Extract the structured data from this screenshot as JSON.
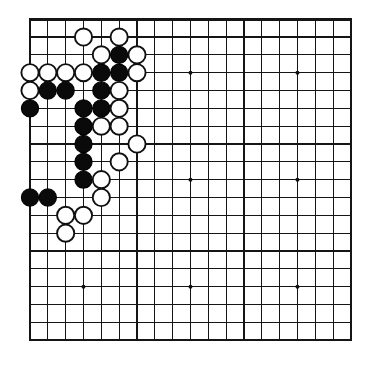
{
  "board": {
    "name": "go-board",
    "size": 19,
    "origin_x": 30,
    "origin_y": 19.2,
    "spacing": 17.83,
    "stone_radius": 8.6,
    "star_radius": 2.0,
    "colors": {
      "background": "#ffffff",
      "line": "#151515",
      "border": "#151515",
      "black_stone": "#0a0a0a",
      "white_stone_fill": "#ffffff",
      "white_stone_edge": "#101010",
      "star_point": "#101010"
    },
    "star_points": [
      {
        "col": 3,
        "row": 3
      },
      {
        "col": 9,
        "row": 3
      },
      {
        "col": 15,
        "row": 3
      },
      {
        "col": 3,
        "row": 9
      },
      {
        "col": 9,
        "row": 9
      },
      {
        "col": 15,
        "row": 9
      },
      {
        "col": 3,
        "row": 15
      },
      {
        "col": 9,
        "row": 15
      },
      {
        "col": 15,
        "row": 15
      }
    ],
    "stones": [
      {
        "col": 3,
        "row": 1,
        "color": "white"
      },
      {
        "col": 5,
        "row": 1,
        "color": "white"
      },
      {
        "col": 4,
        "row": 2,
        "color": "white"
      },
      {
        "col": 5,
        "row": 2,
        "color": "black"
      },
      {
        "col": 6,
        "row": 2,
        "color": "white"
      },
      {
        "col": 0,
        "row": 3,
        "color": "white"
      },
      {
        "col": 1,
        "row": 3,
        "color": "white"
      },
      {
        "col": 2,
        "row": 3,
        "color": "white"
      },
      {
        "col": 3,
        "row": 3,
        "color": "white"
      },
      {
        "col": 4,
        "row": 3,
        "color": "black"
      },
      {
        "col": 5,
        "row": 3,
        "color": "black"
      },
      {
        "col": 6,
        "row": 3,
        "color": "white"
      },
      {
        "col": 0,
        "row": 4,
        "color": "white"
      },
      {
        "col": 1,
        "row": 4,
        "color": "black"
      },
      {
        "col": 2,
        "row": 4,
        "color": "black"
      },
      {
        "col": 4,
        "row": 4,
        "color": "black"
      },
      {
        "col": 5,
        "row": 4,
        "color": "white"
      },
      {
        "col": 0,
        "row": 5,
        "color": "black"
      },
      {
        "col": 3,
        "row": 5,
        "color": "black"
      },
      {
        "col": 4,
        "row": 5,
        "color": "black"
      },
      {
        "col": 5,
        "row": 5,
        "color": "white"
      },
      {
        "col": 3,
        "row": 6,
        "color": "black"
      },
      {
        "col": 4,
        "row": 6,
        "color": "white"
      },
      {
        "col": 5,
        "row": 6,
        "color": "white"
      },
      {
        "col": 3,
        "row": 7,
        "color": "black"
      },
      {
        "col": 6,
        "row": 7,
        "color": "white"
      },
      {
        "col": 3,
        "row": 8,
        "color": "black"
      },
      {
        "col": 5,
        "row": 8,
        "color": "white"
      },
      {
        "col": 3,
        "row": 9,
        "color": "black"
      },
      {
        "col": 4,
        "row": 9,
        "color": "white"
      },
      {
        "col": 0,
        "row": 10,
        "color": "black"
      },
      {
        "col": 1,
        "row": 10,
        "color": "black"
      },
      {
        "col": 4,
        "row": 10,
        "color": "white"
      },
      {
        "col": 2,
        "row": 11,
        "color": "white"
      },
      {
        "col": 3,
        "row": 11,
        "color": "white"
      },
      {
        "col": 2,
        "row": 12,
        "color": "white"
      }
    ]
  }
}
